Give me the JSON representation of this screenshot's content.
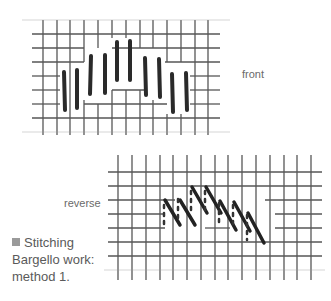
{
  "figure_front": {
    "label": "front",
    "grid": {
      "x0": 28,
      "y0": 20,
      "cols": 15,
      "rows": 8,
      "cell": 13.8
    },
    "stitch_color": "#2a2a2a"
  },
  "figure_reverse": {
    "label": "reverse",
    "stitch_color": "#222222"
  },
  "caption": {
    "bullet_color": "#9a9a9a",
    "line1": "Stitching",
    "line2": "Bargello work:",
    "line3": "method 1."
  }
}
